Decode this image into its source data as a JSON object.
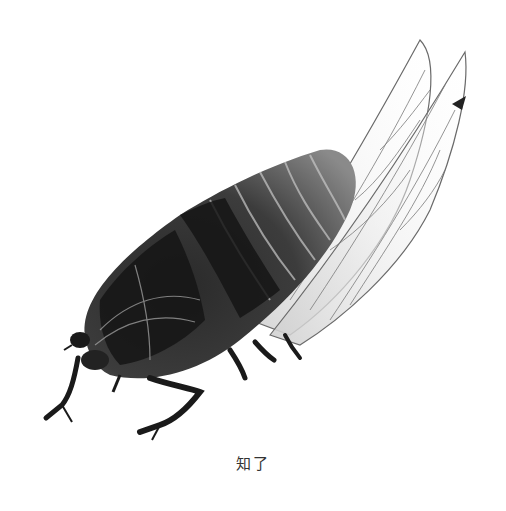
{
  "figure": {
    "caption": "知了",
    "colors": {
      "background": "#ffffff",
      "ink_dark": "#1a1a1a",
      "ink_mid": "#555555",
      "wing_line": "#6a6a6a",
      "caption": "#333333"
    }
  }
}
